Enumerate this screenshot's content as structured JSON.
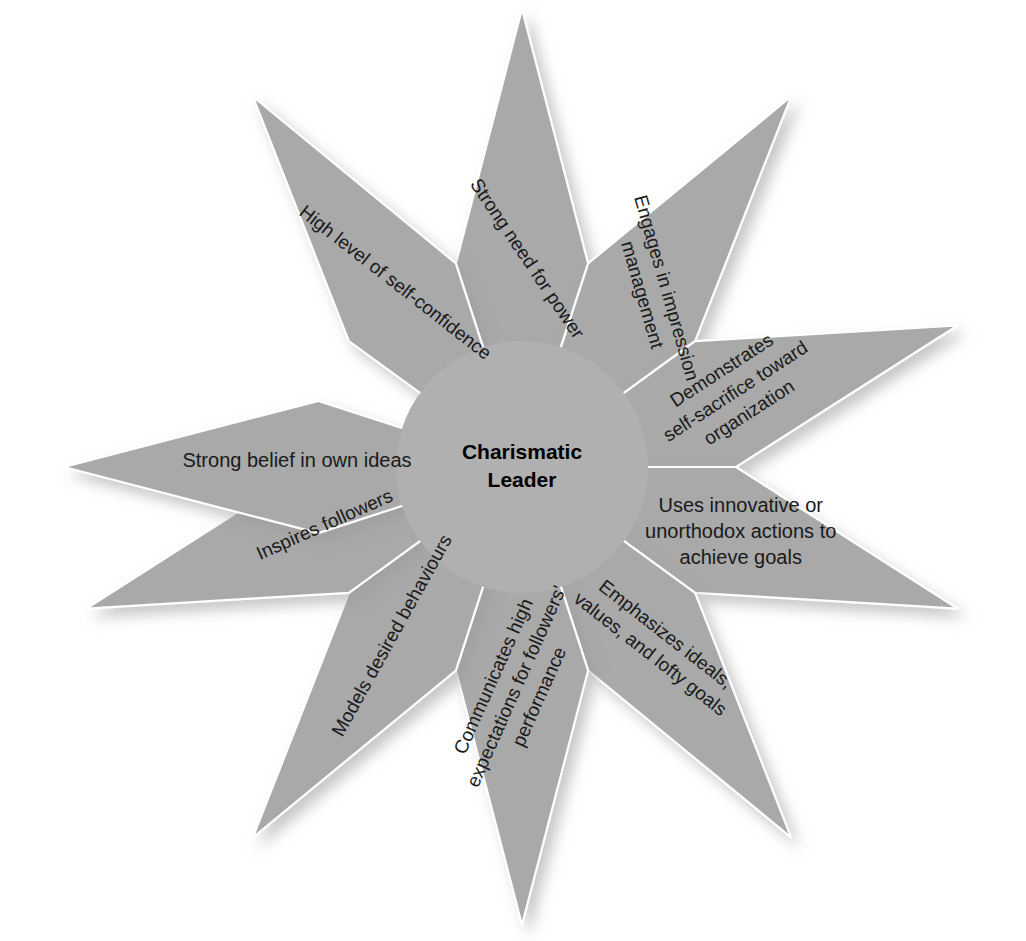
{
  "diagram": {
    "center": {
      "line1": "Charismatic",
      "line2": "Leader"
    },
    "colors": {
      "petal_fill": "#a9a9a9",
      "core_fill": "#b0b0b0",
      "divider": "#ffffff",
      "background": "#ffffff",
      "text": "#1a1a1a",
      "shadow": "#c9c9c9"
    },
    "geometry": {
      "center_x": 522,
      "center_y": 467,
      "outer_radius": 458,
      "inner_radius": 122,
      "points": 10,
      "start_angle_deg": -90
    },
    "petals": [
      {
        "id": "strong-need-for-power",
        "label": "Strong need for power",
        "lines": [
          "Strong need for power"
        ],
        "angle_deg": -90,
        "text_rotation_deg": 56,
        "font_size": 19,
        "radial_offset": 205
      },
      {
        "id": "engages-in-impression-management",
        "label": "Engages in impression management",
        "lines": [
          "Engages in impression",
          "management"
        ],
        "angle_deg": -54,
        "text_rotation_deg": 74,
        "font_size": 19,
        "radial_offset": 215
      },
      {
        "id": "demonstrates-self-sacrifice",
        "label": "Demonstrates self-sacrifice toward organization",
        "lines": [
          "Demonstrates",
          "self-sacrifice toward",
          "organization"
        ],
        "angle_deg": -18,
        "text_rotation_deg": -33,
        "font_size": 19,
        "radial_offset": 228
      },
      {
        "id": "uses-innovative-actions",
        "label": "Uses innovative or unorthodox actions to achieve goals",
        "lines": [
          "Uses innovative or",
          "unorthodox actions to",
          "achieve goals"
        ],
        "angle_deg": 18,
        "text_rotation_deg": 0,
        "font_size": 20,
        "radial_offset": 230
      },
      {
        "id": "emphasizes-ideals",
        "label": "Emphasizes ideals, values, and lofty goals",
        "lines": [
          "Emphasizes ideals,",
          "values, and lofty goals"
        ],
        "angle_deg": 54,
        "text_rotation_deg": 38,
        "font_size": 19,
        "radial_offset": 225
      },
      {
        "id": "communicates-high-expectations",
        "label": "Communicates high expectations for followers' performance",
        "lines": [
          "Communicates high",
          "expectations for followers'",
          "performance"
        ],
        "angle_deg": 90,
        "text_rotation_deg": -66,
        "font_size": 19,
        "radial_offset": 222
      },
      {
        "id": "models-desired-behaviours",
        "label": "Models desired behaviours",
        "lines": [
          "Models desired behaviours"
        ],
        "angle_deg": 126,
        "text_rotation_deg": -61,
        "font_size": 19,
        "radial_offset": 212
      },
      {
        "id": "inspires-followers",
        "label": "Inspires followers",
        "lines": [
          "Inspires followers"
        ],
        "angle_deg": 162,
        "text_rotation_deg": -24,
        "font_size": 19,
        "radial_offset": 205
      },
      {
        "id": "strong-belief-in-own-ideas",
        "label": "Strong belief in own ideas",
        "lines": [
          "Strong belief in own ideas"
        ],
        "angle_deg": 180,
        "text_rotation_deg": 0,
        "font_size": 20,
        "radial_offset": 225
      },
      {
        "id": "high-level-of-self-confidence",
        "label": "High level of self-confidence",
        "lines": [
          "High level of self-confidence"
        ],
        "angle_deg": -126,
        "text_rotation_deg": 38,
        "font_size": 19,
        "radial_offset": 222
      }
    ]
  }
}
